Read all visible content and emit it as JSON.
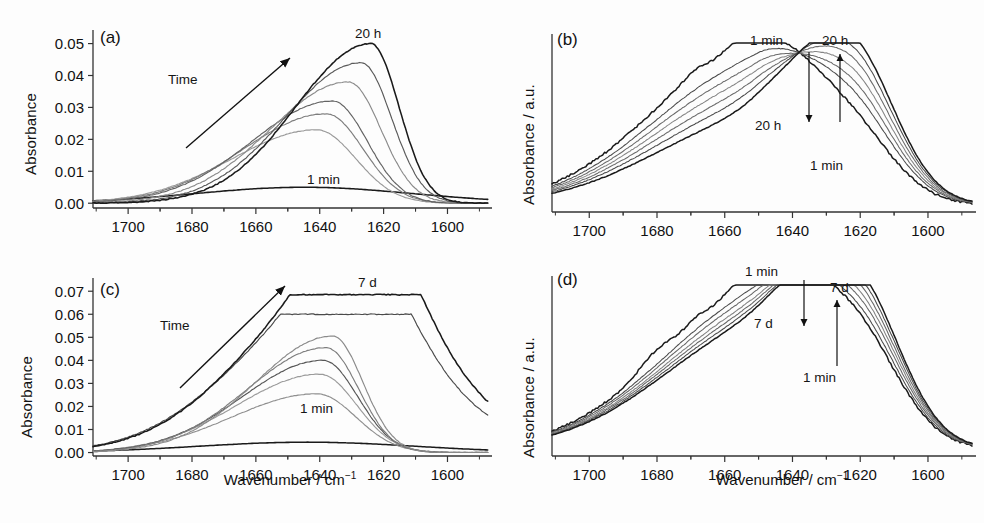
{
  "figure": {
    "xlabel_main": "Wavenumber / cm",
    "xlabel_sup": "−1",
    "ylabel_abs": "Absorbance",
    "ylabel_au_main": "Absorbance / a.u."
  },
  "panels": {
    "a": {
      "tag": "(a)",
      "ylabel": "Absorbance",
      "xlabel": "Wavenumber / cm",
      "xlabel_sup": "−1",
      "annotations": {
        "time": "Time",
        "last": "20 h",
        "first": "1 min"
      },
      "yticks": [
        "0.00",
        "0.01",
        "0.02",
        "0.03",
        "0.04",
        "0.05"
      ],
      "xticks": [
        "1700",
        "1680",
        "1660",
        "1640",
        "1620",
        "1600"
      ]
    },
    "b": {
      "tag": "(b)",
      "ylabel": "Absorbance / a.u.",
      "xlabel": "Wavenumber / cm",
      "xlabel_sup": "−1",
      "annotations": {
        "left_top": "1 min",
        "left_bottom": "20 h",
        "right_top": "20 h",
        "right_bottom": "1 min"
      },
      "xticks": [
        "1700",
        "1680",
        "1660",
        "1640",
        "1620",
        "1600"
      ]
    },
    "c": {
      "tag": "(c)",
      "ylabel": "Absorbance",
      "xlabel": "Wavenumber / cm",
      "xlabel_sup": "−1",
      "annotations": {
        "time": "Time",
        "last": "7 d",
        "first": "1 min"
      },
      "yticks": [
        "0.00",
        "0.01",
        "0.02",
        "0.03",
        "0.04",
        "0.05",
        "0.06",
        "0.07"
      ],
      "xticks": [
        "1700",
        "1680",
        "1660",
        "1640",
        "1620",
        "1600"
      ]
    },
    "d": {
      "tag": "(d)",
      "ylabel": "Absorbance / a.u.",
      "xlabel": "Wavenumber / cm",
      "xlabel_sup": "−1",
      "annotations": {
        "left_top": "1 min",
        "left_bottom": "7 d",
        "right_top": "7 d",
        "right_bottom": "1 min"
      },
      "xticks": [
        "1700",
        "1680",
        "1660",
        "1640",
        "1620",
        "1600"
      ]
    }
  },
  "chart_data": [
    {
      "panel": "a",
      "type": "line",
      "title": "(a)",
      "xlabel": "Wavenumber / cm^-1",
      "ylabel": "Absorbance",
      "xlim": [
        1711,
        1587
      ],
      "ylim": [
        -0.0015,
        0.053
      ],
      "x_reversed": true,
      "xticks": [
        1700,
        1680,
        1660,
        1640,
        1620,
        1600
      ],
      "yticks": [
        0.0,
        0.01,
        0.02,
        0.03,
        0.04,
        0.05
      ],
      "grid": false,
      "legend": "none",
      "annotations": [
        {
          "text": "Time",
          "x": 1672,
          "y": 0.037,
          "kind": "arrow-label"
        },
        {
          "text": "20 h",
          "x": 1627,
          "y": 0.0525,
          "kind": "curve-label"
        },
        {
          "text": "1 min",
          "x": 1645,
          "y": 0.0092,
          "kind": "curve-label"
        }
      ],
      "series": [
        {
          "name": "1 min",
          "peak_wavenumber": 1645,
          "peak_absorbance": 0.005,
          "gray": "#1a1a1a"
        },
        {
          "name": "t1",
          "peak_wavenumber": 1641,
          "peak_absorbance": 0.023,
          "gray": "#9a9a9a"
        },
        {
          "name": "t2",
          "peak_wavenumber": 1638,
          "peak_absorbance": 0.028,
          "gray": "#7d7d7d"
        },
        {
          "name": "t3",
          "peak_wavenumber": 1636,
          "peak_absorbance": 0.032,
          "gray": "#636363"
        },
        {
          "name": "t4",
          "peak_wavenumber": 1631,
          "peak_absorbance": 0.038,
          "gray": "#8a8a8a"
        },
        {
          "name": "t5",
          "peak_wavenumber": 1627,
          "peak_absorbance": 0.044,
          "gray": "#5a5a5a"
        },
        {
          "name": "20 h",
          "peak_wavenumber": 1624,
          "peak_absorbance": 0.05,
          "gray": "#1a1a1a"
        }
      ]
    },
    {
      "panel": "b",
      "type": "line",
      "title": "(b)",
      "xlabel": "Wavenumber / cm^-1",
      "ylabel": "Absorbance / a.u.",
      "xlim": [
        1711,
        1587
      ],
      "ylim": [
        0,
        1.05
      ],
      "x_reversed": true,
      "xticks": [
        1700,
        1680,
        1660,
        1640,
        1620,
        1600
      ],
      "grid": false,
      "legend": "none",
      "normalized": true,
      "isosbestic_point": 1643,
      "annotations": [
        {
          "text": "1 min",
          "x": 1650,
          "y": 1.0,
          "kind": "arrow-label"
        },
        {
          "text": "20 h",
          "x": 1648,
          "y": 0.52,
          "kind": "arrow-label"
        },
        {
          "text": "20 h",
          "x": 1620,
          "y": 0.99,
          "kind": "arrow-label"
        },
        {
          "text": "1 min",
          "x": 1612,
          "y": 0.4,
          "kind": "arrow-label"
        }
      ],
      "series": [
        {
          "name": "1 min",
          "left_peak": 0.93,
          "right_peak": 0.37,
          "gray": "#1a1a1a"
        },
        {
          "name": "t1",
          "left_peak": 0.82,
          "right_peak": 0.5,
          "gray": "#4a4a4a"
        },
        {
          "name": "t2",
          "left_peak": 0.75,
          "right_peak": 0.58,
          "gray": "#6a6a6a"
        },
        {
          "name": "t3",
          "left_peak": 0.69,
          "right_peak": 0.66,
          "gray": "#858585"
        },
        {
          "name": "t4",
          "left_peak": 0.63,
          "right_peak": 0.74,
          "gray": "#6a6a6a"
        },
        {
          "name": "t5",
          "left_peak": 0.57,
          "right_peak": 0.82,
          "gray": "#4a4a4a"
        },
        {
          "name": "20 h",
          "left_peak": 0.5,
          "right_peak": 0.9,
          "gray": "#1a1a1a"
        }
      ]
    },
    {
      "panel": "c",
      "type": "line",
      "title": "(c)",
      "xlabel": "Wavenumber / cm^-1",
      "ylabel": "Absorbance",
      "xlim": [
        1711,
        1587
      ],
      "ylim": [
        -0.0015,
        0.074
      ],
      "x_reversed": true,
      "xticks": [
        1700,
        1680,
        1660,
        1640,
        1620,
        1600
      ],
      "yticks": [
        0.0,
        0.01,
        0.02,
        0.03,
        0.04,
        0.05,
        0.06,
        0.07
      ],
      "grid": false,
      "legend": "none",
      "annotations": [
        {
          "text": "Time",
          "x": 1673,
          "y": 0.05,
          "kind": "arrow-label"
        },
        {
          "text": "7 d",
          "x": 1629,
          "y": 0.0725,
          "kind": "curve-label"
        },
        {
          "text": "1 min",
          "x": 1645,
          "y": 0.0108,
          "kind": "curve-label"
        }
      ],
      "series": [
        {
          "name": "1 min",
          "peak_wavenumber": 1644,
          "peak_absorbance": 0.0045,
          "gray": "#1a1a1a"
        },
        {
          "name": "t1",
          "peak_wavenumber": 1641,
          "peak_absorbance": 0.0255,
          "gray": "#8f8f8f"
        },
        {
          "name": "t2",
          "peak_wavenumber": 1640,
          "peak_absorbance": 0.034,
          "gray": "#9a9a9a"
        },
        {
          "name": "t3",
          "peak_wavenumber": 1639,
          "peak_absorbance": 0.04,
          "gray": "#555555"
        },
        {
          "name": "t4",
          "peak_wavenumber": 1638,
          "peak_absorbance": 0.0455,
          "gray": "#7d7d7d"
        },
        {
          "name": "t5",
          "peak_wavenumber": 1636,
          "peak_absorbance": 0.0505,
          "gray": "#8a8a8a"
        },
        {
          "name": "t6",
          "peak_wavenumber": 1633,
          "peak_absorbance": 0.06,
          "gray": "#4a4a4a"
        },
        {
          "name": "7 d",
          "peak_wavenumber": 1630,
          "peak_absorbance": 0.0685,
          "gray": "#1a1a1a"
        }
      ]
    },
    {
      "panel": "d",
      "type": "line",
      "title": "(d)",
      "xlabel": "Wavenumber / cm^-1",
      "ylabel": "Absorbance / a.u.",
      "xlim": [
        1711,
        1587
      ],
      "ylim": [
        0,
        1.05
      ],
      "x_reversed": true,
      "xticks": [
        1700,
        1680,
        1660,
        1640,
        1620,
        1600
      ],
      "grid": false,
      "legend": "none",
      "normalized": true,
      "isosbestic_point": 1636,
      "annotations": [
        {
          "text": "1 min",
          "x": 1648,
          "y": 1.0,
          "kind": "arrow-label"
        },
        {
          "text": "7 d",
          "x": 1647,
          "y": 0.62,
          "kind": "arrow-label"
        },
        {
          "text": "7 d",
          "x": 1622,
          "y": 0.92,
          "kind": "arrow-label"
        },
        {
          "text": "1 min",
          "x": 1613,
          "y": 0.48,
          "kind": "arrow-label"
        }
      ],
      "series": [
        {
          "name": "1 min",
          "left_peak": 0.95,
          "right_peak": 0.56,
          "gray": "#1a1a1a"
        },
        {
          "name": "t1",
          "left_peak": 0.89,
          "right_peak": 0.62,
          "gray": "#4a4a4a"
        },
        {
          "name": "t2",
          "left_peak": 0.85,
          "right_peak": 0.68,
          "gray": "#666666"
        },
        {
          "name": "t3",
          "left_peak": 0.81,
          "right_peak": 0.73,
          "gray": "#808080"
        },
        {
          "name": "t4",
          "left_peak": 0.78,
          "right_peak": 0.78,
          "gray": "#666666"
        },
        {
          "name": "t5",
          "left_peak": 0.75,
          "right_peak": 0.83,
          "gray": "#4a4a4a"
        },
        {
          "name": "7 d",
          "left_peak": 0.72,
          "right_peak": 0.88,
          "gray": "#1a1a1a"
        }
      ]
    }
  ]
}
